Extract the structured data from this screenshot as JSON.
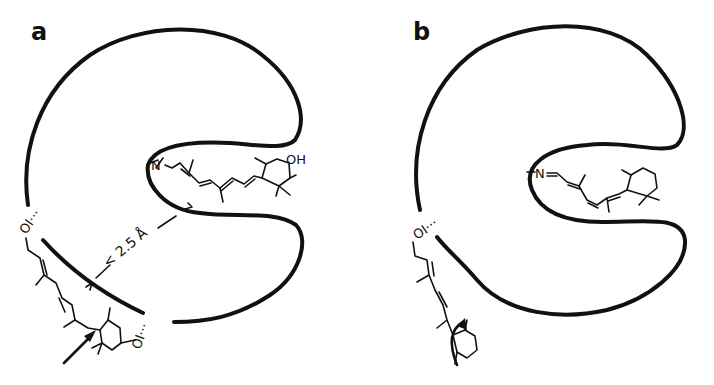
{
  "figure": {
    "panels": [
      {
        "id": "a",
        "label": "a",
        "bound_ligand": {
          "end_label": "N",
          "substituent": "OH",
          "description": "retinal chromophore with hydroxylated ring bound inside pocket"
        },
        "outside_ligand": {
          "top_group": "OI···",
          "bottom_group": "OI···",
          "description": "retinoid attached outside pocket via hydrogen bonds"
        },
        "annotation": {
          "text": "< 2.5 Å",
          "arrows": 2
        },
        "highlight_arrow": "pointer to ring–chain junction"
      },
      {
        "id": "b",
        "label": "b",
        "bound_ligand": {
          "end_label": "N",
          "description": "retinal chromophore bound inside pocket"
        },
        "outside_ligand": {
          "top_group": "OI···",
          "description": "retinoid with rotating ring (curved arrow)"
        },
        "rotation_arrow": "ring rotation"
      }
    ],
    "colors": {
      "line": "#111111",
      "background": "#ffffff"
    }
  }
}
